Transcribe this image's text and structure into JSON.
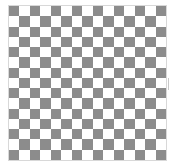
{
  "board": {
    "type": "checkerboard",
    "rows": 15,
    "cols": 15,
    "top_left": "dark",
    "colors": {
      "dark": "#8c8c8c",
      "light": "#ffffff",
      "background": "#ffffff"
    }
  }
}
